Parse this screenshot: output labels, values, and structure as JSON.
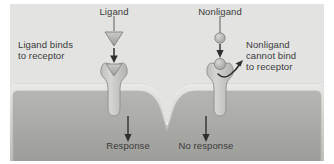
{
  "figure": {
    "kind": "receptor-specificity-diagram",
    "background_outer": "#ffffff",
    "background_extracellular": "#e3e3e1",
    "cytoplasm_color": "#a9a9a7",
    "membrane_color": "#cfcfcc",
    "protein_color": "#c9c9c5",
    "text_color": "#3a3a3a"
  },
  "labels": {
    "ligand_title": "Ligand",
    "nonligand_title": "Nonligand",
    "ligand_binds_line1": "Ligand binds",
    "ligand_binds_line2": "to receptor",
    "nonligand_line1": "Nonligand",
    "nonligand_line2": "cannot bind",
    "nonligand_line3": "to receptor",
    "response": "Response",
    "no_response": "No response"
  },
  "left_panel": {
    "molecule_shape": "triangle",
    "molecule_name": "ligand-molecule",
    "binds": true,
    "outcome": "Response"
  },
  "right_panel": {
    "molecule_shape": "circle",
    "molecule_name": "nonligand-molecule",
    "binds": false,
    "outcome": "No response",
    "deflection": "curved-arrow"
  }
}
